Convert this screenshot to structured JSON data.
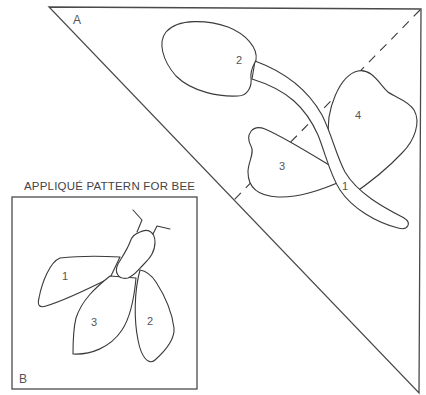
{
  "figure": {
    "title": "APPLIQUÉ PATTERN FOR BEE",
    "colors": {
      "line": "#3a3a3a",
      "text": "#555555",
      "background": "#ffffff"
    }
  },
  "panel_a": {
    "label": "A",
    "shape": "right-triangle",
    "fold_line": "dashed diagonal",
    "pieces": [
      {
        "id": "1",
        "label": "1",
        "part": "stem"
      },
      {
        "id": "2",
        "label": "2",
        "part": "flower-bud"
      },
      {
        "id": "3",
        "label": "3",
        "part": "left-leaf"
      },
      {
        "id": "4",
        "label": "4",
        "part": "right-leaf"
      }
    ]
  },
  "panel_b": {
    "label": "B",
    "shape": "square",
    "caption": "APPLIQUÉ PATTERN FOR BEE",
    "pieces": [
      {
        "id": "1",
        "label": "1",
        "part": "upper-left-wing"
      },
      {
        "id": "2",
        "label": "2",
        "part": "right-wing"
      },
      {
        "id": "3",
        "label": "3",
        "part": "lower-left-wing"
      },
      {
        "id": "body",
        "label": "",
        "part": "body-with-antennae"
      }
    ]
  }
}
